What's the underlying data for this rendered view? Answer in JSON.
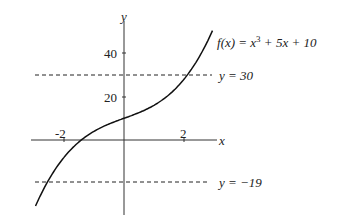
{
  "chart_data": {
    "type": "line",
    "title": "",
    "function_label": "f(x) = x³ + 5x + 10",
    "xlabel": "x",
    "ylabel": "y",
    "x_ticks": [
      {
        "value": -2,
        "label": "-2"
      },
      {
        "value": 2,
        "label": "2"
      }
    ],
    "y_ticks": [
      {
        "value": 20,
        "label": "20"
      },
      {
        "value": 40,
        "label": "40"
      }
    ],
    "xlim": [
      -3.1,
      3.1
    ],
    "ylim": [
      -35,
      57
    ],
    "grid": false,
    "series": [
      {
        "name": "f(x) = x^3 + 5x + 10",
        "style": "solid",
        "x": [
          -2.95,
          -2.5,
          -2,
          -1.5,
          -1.5,
          -1,
          -0.5,
          0,
          0.5,
          1,
          1.5,
          2,
          2.5,
          2.95
        ],
        "y": [
          -30.4,
          -18.1,
          -8,
          -0.9,
          -0.9,
          4,
          7.4,
          10,
          12.6,
          16,
          20.9,
          28,
          38.1,
          49.4
        ]
      },
      {
        "name": "y = 30",
        "style": "dashed",
        "x": [
          -3,
          2.95
        ],
        "y": [
          30,
          30
        ]
      },
      {
        "name": "y = -19",
        "style": "dashed",
        "x": [
          -3,
          2.95
        ],
        "y": [
          -19,
          -19
        ]
      }
    ],
    "annotations": [
      {
        "text": "f(x) = x³ + 5x + 10"
      },
      {
        "text": "y = 30"
      },
      {
        "text": "y = −19"
      }
    ]
  },
  "labels": {
    "y_axis": "y",
    "x_axis": "x",
    "tick_40": "40",
    "tick_20": "20",
    "tick_neg2": "-2",
    "tick_2": "2",
    "func_f": "f",
    "func_rest": "(x) = x",
    "func_exp": "3",
    "func_tail": " + 5x + 10",
    "line30": "y = 30",
    "line_neg19": "y = −19"
  }
}
